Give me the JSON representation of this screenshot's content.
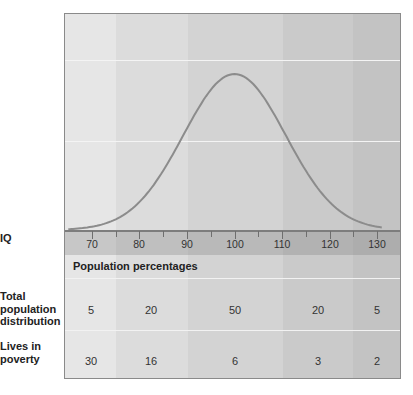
{
  "chart_data": {
    "type": "line",
    "title": "",
    "xlabel": "IQ",
    "ylabel": "",
    "x_ticks": [
      70,
      80,
      90,
      100,
      110,
      120,
      130
    ],
    "xlim": [
      65,
      135
    ],
    "grid": true,
    "series": [
      {
        "name": "Normal distribution of IQ",
        "mean": 100,
        "sd": 15,
        "peak_x": 100
      }
    ],
    "table": {
      "section_title": "Population percentages",
      "iq_ranges": [
        "<75",
        "75-90",
        "90-110",
        "110-125",
        ">125"
      ],
      "rows": [
        {
          "label": "Total population distribution",
          "values": [
            5,
            20,
            50,
            20,
            5
          ]
        },
        {
          "label": "Lives in poverty",
          "values": [
            30,
            16,
            6,
            3,
            2
          ]
        }
      ]
    }
  },
  "labels": {
    "iq": "IQ",
    "total_line1": "Total",
    "total_line2": "population",
    "total_line3": "distribution",
    "poverty_line1": "Lives in",
    "poverty_line2": "poverty",
    "section_title": "Population percentages"
  },
  "ticks": [
    "70",
    "80",
    "90",
    "100",
    "110",
    "120",
    "130"
  ],
  "total_row": [
    "5",
    "20",
    "50",
    "20",
    "5"
  ],
  "poverty_row": [
    "30",
    "16",
    "6",
    "3",
    "2"
  ],
  "colors": {
    "band1": "#e6e6e6",
    "band2": "#dcdcdc",
    "band3": "#d3d3d3",
    "band4": "#cacaca",
    "band5": "#c3c3c3",
    "curve": "#8c8c8c"
  }
}
